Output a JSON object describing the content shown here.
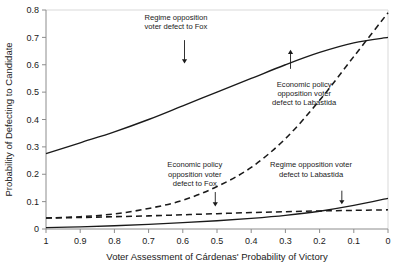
{
  "chart_data": {
    "type": "line",
    "title": "",
    "xlabel": "Voter Assessment of Cárdenas' Probability of Victory",
    "ylabel": "Probability of Defecting to Candidate",
    "xlim": [
      1,
      0
    ],
    "ylim": [
      0,
      0.8
    ],
    "x_reversed": true,
    "grid": false,
    "legend": "none (inline annotations)",
    "xticks": [
      "1",
      "0.9",
      "0.8",
      "0.7",
      "0.6",
      "0.5",
      "0.4",
      "0.3",
      "0.2",
      "0.1",
      "0"
    ],
    "xtick_values": [
      1,
      0.9,
      0.8,
      0.7,
      0.6,
      0.5,
      0.4,
      0.3,
      0.2,
      0.1,
      0
    ],
    "yticks": [
      "0",
      "0.1",
      "0.2",
      "0.3",
      "0.4",
      "0.5",
      "0.6",
      "0.7",
      "0.8"
    ],
    "ytick_values": [
      0,
      0.1,
      0.2,
      0.3,
      0.4,
      0.5,
      0.6,
      0.7,
      0.8
    ],
    "x": [
      1,
      0.9,
      0.8,
      0.7,
      0.6,
      0.5,
      0.4,
      0.3,
      0.2,
      0.1,
      0
    ],
    "series": [
      {
        "name": "Regime opposition voter defect to Fox",
        "style": "solid",
        "color": "#1a1a1a",
        "values": [
          0.275,
          0.315,
          0.355,
          0.4,
          0.45,
          0.5,
          0.55,
          0.6,
          0.645,
          0.68,
          0.7
        ]
      },
      {
        "name": "Economic policy opposition voter defect to Labastida",
        "style": "dashed",
        "color": "#1a1a1a",
        "values": [
          0.04,
          0.045,
          0.055,
          0.075,
          0.105,
          0.155,
          0.225,
          0.33,
          0.47,
          0.63,
          0.79
        ]
      },
      {
        "name": "Economic policy opposition voter defect to Fox",
        "style": "dashed",
        "color": "#1a1a1a",
        "values": [
          0.04,
          0.042,
          0.045,
          0.048,
          0.052,
          0.056,
          0.06,
          0.063,
          0.066,
          0.068,
          0.07
        ]
      },
      {
        "name": "Regime opposition voter defect to Labastida",
        "style": "solid",
        "color": "#1a1a1a",
        "values": [
          0.005,
          0.008,
          0.012,
          0.017,
          0.023,
          0.03,
          0.039,
          0.05,
          0.065,
          0.086,
          0.112
        ]
      }
    ],
    "annotations": [
      {
        "id": "annot-regime-fox",
        "lines": [
          "Regime opposition",
          "voter defect to Fox"
        ],
        "text_x": 0.62,
        "text_y": 0.765,
        "arrow_x": 0.595,
        "arrow_from_y": 0.69,
        "arrow_to_y": 0.605,
        "target_series": "Regime opposition voter defect to Fox"
      },
      {
        "id": "annot-econ-labastida",
        "lines": [
          "Economic policy",
          "opposition voter",
          "defect to Labastida"
        ],
        "text_x": 0.245,
        "text_y": 0.52,
        "arrow_x": 0.285,
        "arrow_from_y": 0.585,
        "arrow_to_y": 0.655,
        "target_series": "Economic policy opposition voter defect to Labastida"
      },
      {
        "id": "annot-econ-fox",
        "lines": [
          "Economic policy",
          "opposition voter",
          "defect to Fox"
        ],
        "text_x": 0.565,
        "text_y": 0.225,
        "arrow_x": 0.505,
        "arrow_from_y": 0.135,
        "arrow_to_y": 0.082,
        "target_series": "Economic policy opposition voter defect to Fox"
      },
      {
        "id": "annot-regime-labastida",
        "lines": [
          "Regime opposition voter",
          "defect to Labastida"
        ],
        "text_x": 0.225,
        "text_y": 0.225,
        "arrow_x": 0.135,
        "arrow_from_y": 0.14,
        "arrow_to_y": 0.09,
        "target_series": "Regime opposition voter defect to Labastida"
      }
    ]
  }
}
